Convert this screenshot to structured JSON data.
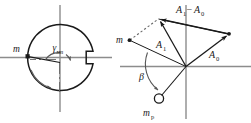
{
  "figure": {
    "background_color": "#ffffff",
    "line_color": "#1a1a1a",
    "axis_color": "#8c8c8c",
    "dashed_color": "#6e6e6e"
  },
  "left_diagram": {
    "name": "rotor-cross-section",
    "description": "Circular rotor cross-section with keyway notch, unbalance mass marker and rotation arrow",
    "labels": {
      "mass_marker": "m",
      "angle": "γ",
      "angle_subscript": "m"
    },
    "geometry": {
      "center_x": 60,
      "center_y": 57,
      "radius": 33,
      "notch_width": 7,
      "notch_height": 12,
      "mass_angle_deg": 172,
      "rotation_direction": "counterclockwise"
    }
  },
  "right_diagram": {
    "name": "vector-diagram",
    "description": "Vector triangle showing A0, A1 and the difference A1 minus A0 with trial mass at angle beta",
    "labels": {
      "mass_point": "m",
      "vector_a1": "A",
      "vector_a1_sub": "1",
      "vector_a0": "A",
      "vector_a0_sub": "0",
      "vector_diff": "A₁−A₀",
      "vector_diff_a": "A",
      "vector_diff_a_sub": "1",
      "vector_diff_minus": "−",
      "vector_diff_b": "A",
      "vector_diff_b_sub": "0",
      "angle_beta": "β",
      "trial_mass": "m",
      "trial_mass_sub": "p"
    },
    "geometry": {
      "origin_x": 186,
      "origin_y": 66,
      "a0_tip_x": 229,
      "a0_tip_y": 34,
      "a1_tip_x": 159,
      "a1_tip_y": 18,
      "m_point_x": 127,
      "m_point_y": 40,
      "trial_mass_x": 158,
      "trial_mass_y": 99,
      "trial_mass_radius": 5,
      "beta_deg": 125
    }
  },
  "axes": {
    "left_horizontal": {
      "x1": 0,
      "y1": 57,
      "x2": 110,
      "y2": 57
    },
    "left_vertical": {
      "x1": 60,
      "y1": 6,
      "x2": 60,
      "y2": 110
    },
    "right_horizontal": {
      "x1": 120,
      "y1": 66,
      "x2": 251,
      "y2": 66
    },
    "right_vertical": {
      "x1": 186,
      "y1": 6,
      "x2": 186,
      "y2": 118
    }
  }
}
